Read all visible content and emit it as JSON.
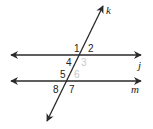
{
  "diagram": {
    "type": "parallel-lines-with-transversal",
    "lines": {
      "j": {
        "label": "j"
      },
      "m": {
        "label": "m"
      },
      "k": {
        "label": "k"
      }
    },
    "angles": [
      {
        "n": "1",
        "faded": false
      },
      {
        "n": "2",
        "faded": false
      },
      {
        "n": "3",
        "faded": true
      },
      {
        "n": "4",
        "faded": false
      },
      {
        "n": "5",
        "faded": false
      },
      {
        "n": "6",
        "faded": true
      },
      {
        "n": "7",
        "faded": false
      },
      {
        "n": "8",
        "faded": false
      }
    ],
    "colors": {
      "line": "#2a2a2a",
      "faded_label": "#c8c8c8"
    }
  }
}
